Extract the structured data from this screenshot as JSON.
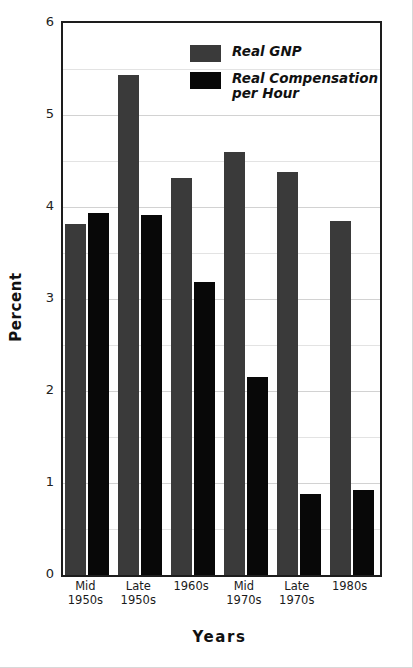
{
  "chart_data": {
    "type": "bar",
    "title": "",
    "subtitle": "",
    "xlabel": "Years",
    "ylabel": "Percent",
    "ylim": [
      0,
      6
    ],
    "yticks": [
      0,
      1,
      2,
      3,
      4,
      5,
      6
    ],
    "ytick_labels": [
      "0",
      "1",
      "2",
      "3",
      "4",
      "5",
      "6"
    ],
    "minor_gridlines": [
      0.5,
      1.5,
      2.5,
      3.5,
      4.5,
      5.5
    ],
    "grid": true,
    "legend_position": "top-center-right",
    "categories": [
      "Mid\n1950s",
      "Late\n1950s",
      "1960s",
      "Mid\n1970s",
      "Late\n1970s",
      "1980s"
    ],
    "series": [
      {
        "name": "Real GNP",
        "color": "#3a3a3a",
        "values": [
          3.82,
          5.44,
          4.31,
          4.6,
          4.38,
          3.85
        ]
      },
      {
        "name": "Real Compensation\nper Hour",
        "color": "#080808",
        "values": [
          3.94,
          3.91,
          3.18,
          2.15,
          0.88,
          0.92
        ]
      }
    ]
  },
  "legend": {
    "entries": [
      {
        "label": "Real GNP",
        "swatch": "gnp-swatch"
      },
      {
        "label": "Real Compensation\nper Hour",
        "swatch": "comp-swatch"
      }
    ]
  }
}
